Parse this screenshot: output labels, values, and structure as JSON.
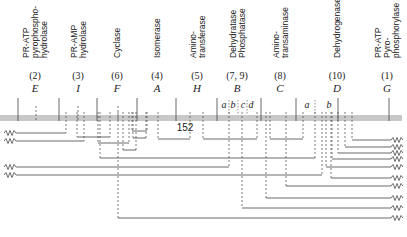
{
  "diagram": {
    "title": "",
    "band": {
      "y": 115,
      "height": 6,
      "x1": 0,
      "x2": 402,
      "color": "#c8c8c8"
    },
    "enzymes": [
      {
        "id": "E",
        "lines": [
          "PR-ATP",
          "pyrophospho-",
          "hydrolase"
        ],
        "number": "(2)",
        "gene": "E",
        "x": 35
      },
      {
        "id": "I",
        "lines": [
          "PR-AMP",
          "hydrolase"
        ],
        "number": "(3)",
        "gene": "I",
        "x": 78
      },
      {
        "id": "F",
        "lines": [
          "Cyclase"
        ],
        "number": "(6)",
        "gene": "F",
        "x": 117
      },
      {
        "id": "A",
        "lines": [
          "Isomerase"
        ],
        "number": "(4)",
        "gene": "A",
        "x": 157
      },
      {
        "id": "H",
        "lines": [
          "Amino-",
          "transferase"
        ],
        "number": "(5)",
        "gene": "H",
        "x": 197
      },
      {
        "id": "B",
        "lines": [
          "Dehydratase",
          "Phosphatase"
        ],
        "number": "(7, 9)",
        "gene": "B",
        "x": 237
      },
      {
        "id": "C",
        "lines": [
          "Amino-",
          "transaminase"
        ],
        "number": "(8)",
        "gene": "C",
        "x": 280
      },
      {
        "id": "D",
        "lines": [
          "Dehydrogenase"
        ],
        "number": "(10)",
        "gene": "D",
        "x": 337
      },
      {
        "id": "G",
        "lines": [
          "PR-ATP",
          "Pyro-",
          "phosphorylase"
        ],
        "number": "(1)",
        "gene": "G",
        "x": 387
      }
    ],
    "boundaries": [
      18,
      59,
      97,
      137,
      176,
      217,
      261,
      296,
      338,
      389
    ],
    "gene_center_ticks": [
      36,
      78,
      118
    ],
    "sublabels": [
      {
        "text": "a",
        "x": 224,
        "y": 108
      },
      {
        "text": "b",
        "x": 233,
        "y": 108
      },
      {
        "text": "c",
        "x": 243,
        "y": 108
      },
      {
        "text": "d",
        "x": 251,
        "y": 108
      },
      {
        "text": "a",
        "x": 307,
        "y": 108
      },
      {
        "text": "b",
        "x": 329,
        "y": 108
      }
    ],
    "sub_dividers": [
      229,
      238,
      247,
      315
    ],
    "mid_label": {
      "text": "152",
      "x": 185,
      "y": 131
    },
    "deletions_left": [
      {
        "y": 133,
        "x_end": 66
      },
      {
        "y": 141,
        "x_end": 84
      },
      {
        "y": 167,
        "x_end": 229
      },
      {
        "y": 175,
        "x_end": 322
      }
    ],
    "deletions_right": [
      {
        "y": 140,
        "x_start": 352
      },
      {
        "y": 147,
        "x_start": 345
      },
      {
        "y": 153,
        "x_start": 338
      },
      {
        "y": 159,
        "x_start": 332
      },
      {
        "y": 167,
        "x_start": 326
      },
      {
        "y": 178,
        "x_start": 331
      },
      {
        "y": 186,
        "x_start": 286
      },
      {
        "y": 198,
        "x_start": 266
      },
      {
        "y": 208,
        "x_start": 242
      },
      {
        "y": 218,
        "x_start": 118
      }
    ],
    "internal_deletions": [
      {
        "x1": 77,
        "x2": 110,
        "y": 137
      },
      {
        "x1": 98,
        "x2": 129,
        "y": 143
      },
      {
        "x1": 123,
        "x2": 136,
        "y": 150
      },
      {
        "x1": 133,
        "x2": 146,
        "y": 138
      },
      {
        "x1": 132,
        "x2": 147,
        "y": 131
      },
      {
        "x1": 100,
        "x2": 315,
        "y": 158
      },
      {
        "x1": 158,
        "x2": 190,
        "y": 139
      },
      {
        "x1": 203,
        "x2": 257,
        "y": 139
      },
      {
        "x1": 270,
        "x2": 303,
        "y": 139
      },
      {
        "x1": 0,
        "x2": 315,
        "y": 158
      }
    ],
    "colors": {
      "line": "#444444",
      "band": "#c8c8c8",
      "text": "#222222"
    }
  }
}
